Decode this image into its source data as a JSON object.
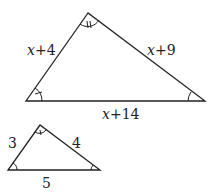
{
  "large_triangle": {
    "side_left": {
      "var": "x",
      "rest": "+4"
    },
    "side_right": {
      "var": "x",
      "rest": "+9"
    },
    "side_bottom": {
      "var": "x",
      "rest": "+14"
    },
    "angle_marks": {
      "apex": "double-tick",
      "left": "single-tick",
      "right": "plain-arc"
    }
  },
  "small_triangle": {
    "side_left": "3",
    "side_right": "4",
    "side_bottom": "5",
    "angle_marks": {
      "apex": "single-tick",
      "left": "plain-arc",
      "right": "plain-arc"
    }
  },
  "colors": {
    "stroke": "#222222",
    "background": "#ffffff"
  }
}
